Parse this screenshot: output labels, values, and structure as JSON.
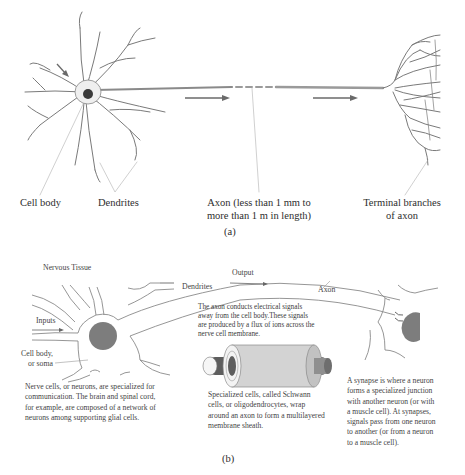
{
  "panel_a": {
    "caption": "(a)",
    "labels": {
      "cell_body": "Cell body",
      "dendrites": "Dendrites",
      "axon_line1": "Axon (less than 1 mm to",
      "axon_line2": "more than 1 m in length)",
      "terminal_line1": "Terminal branches",
      "terminal_line2": "of axon"
    }
  },
  "panel_b": {
    "caption": "(b)",
    "title": "Nervous Tissue",
    "labels": {
      "dendrites": "Dendrites",
      "output": "Output",
      "axon": "Axon",
      "inputs": "Inputs",
      "cell_body_line1": "Cell body,",
      "cell_body_line2": "or soma"
    },
    "axon_note": {
      "line1": "The axon conducts electrical signals",
      "line2": "away from the cell body.These signals",
      "line3": "are produced by a flux of ions across the",
      "line4": "nerve cell membrane."
    },
    "neuron_note": {
      "line1": "Nerve cells, or neurons, are specialized for",
      "line2": "communication. The brain and spinal cord,",
      "line3": "for example, are composed of a network of",
      "line4": "neurons among supporting glial cells."
    },
    "schwann_note": {
      "line1": "Specialized cells, called Schwann",
      "line2": "cells, or oligodendrocytes, wrap",
      "line3": "around an axon to form a multilayered",
      "line4": "membrane sheath."
    },
    "synapse_note": {
      "line1": "A synapse is where a neuron",
      "line2": "forms a specialized junction",
      "line3": "with another neuron (or with",
      "line4": "a muscle cell). At synapses,",
      "line5": "signals pass from one neuron",
      "line6": "to another (or from a neuron",
      "line7": "to a muscle cell)."
    }
  },
  "colors": {
    "line": "#7a7a7a",
    "nucleus": "#7d7d7d",
    "soma_dark": "#3a3a3a",
    "arrow": "#6a6a6a"
  }
}
